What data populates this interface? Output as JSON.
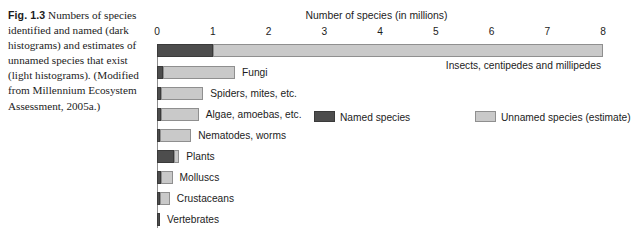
{
  "caption": {
    "figure_number": "Fig. 1.3",
    "text": "Numbers of species identified and named (dark histograms) and estimates of unnamed species that exist (light histograms). (Modified from Millennium Ecosystem Assessment, 2005a.)"
  },
  "colors": {
    "named": "#4d4d4d",
    "unnamed": "#c9c9c9",
    "axis": "#8d8d8d",
    "text": "#1c1c1c",
    "background": "#ffffff"
  },
  "chart_data": {
    "type": "bar",
    "orientation": "horizontal",
    "stacked": true,
    "title": "",
    "xlabel": "Number of species (in millions)",
    "ylabel": "",
    "xlim": [
      0,
      8
    ],
    "xticks": [
      0,
      1,
      2,
      3,
      4,
      5,
      6,
      7,
      8
    ],
    "xtick_labels": [
      "0",
      "1",
      "2",
      "3",
      "4",
      "5",
      "6",
      "7",
      "8"
    ],
    "grid": false,
    "legend_position": "center",
    "categories": [
      "Insects, centipedes and millipedes",
      "Fungi",
      "Spiders, mites, etc.",
      "Algae, amoebas, etc.",
      "Nematodes, worms",
      "Plants",
      "Molluscs",
      "Crustaceans",
      "Vertebrates"
    ],
    "series": [
      {
        "name": "Named species",
        "color": "#4d4d4d",
        "values": [
          1.0,
          0.1,
          0.08,
          0.07,
          0.03,
          0.3,
          0.08,
          0.06,
          0.05
        ]
      },
      {
        "name": "Unnamed species (estimate)",
        "color": "#c9c9c9",
        "values": [
          7.0,
          1.3,
          0.75,
          0.68,
          0.56,
          0.1,
          0.2,
          0.17,
          0.0
        ]
      }
    ],
    "totals": [
      8.0,
      1.4,
      0.83,
      0.75,
      0.59,
      0.4,
      0.28,
      0.23,
      0.05
    ],
    "label_placement": [
      "below-bar-right",
      "right",
      "right",
      "right",
      "right",
      "right",
      "right",
      "right",
      "right"
    ]
  },
  "legend": {
    "items": [
      {
        "label": "Named species",
        "swatch": "named"
      },
      {
        "label": "Unnamed species (estimate)",
        "swatch": "unnamed"
      }
    ]
  }
}
